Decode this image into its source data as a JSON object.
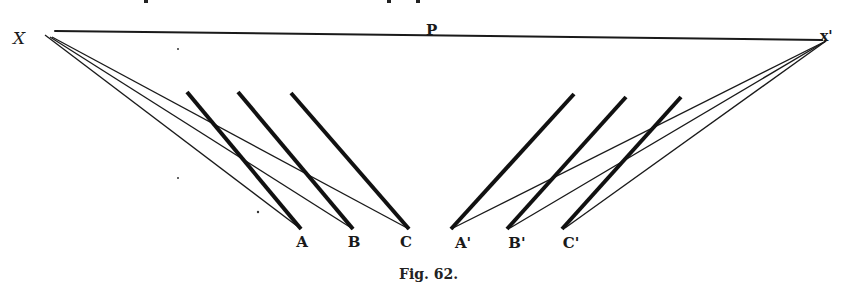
{
  "figure": {
    "caption": "Fig. 62.",
    "colors": {
      "ink": "#1a1a1a",
      "background": "#ffffff"
    },
    "points": {
      "X": {
        "label": "X",
        "x": 45,
        "y": 33
      },
      "X_prime": {
        "label": "x'",
        "x": 826,
        "y": 40
      },
      "P": {
        "label": "P",
        "x": 432,
        "y": 36
      }
    },
    "horizon_line": {
      "x1": 55,
      "y1": 31,
      "x2": 822,
      "y2": 40
    },
    "thick_segments": [
      {
        "name": "segment-A",
        "x1": 187,
        "y1": 92,
        "x2": 301,
        "y2": 229
      },
      {
        "name": "segment-B",
        "x1": 238,
        "y1": 92,
        "x2": 353,
        "y2": 229
      },
      {
        "name": "segment-C",
        "x1": 291,
        "y1": 93,
        "x2": 409,
        "y2": 229
      },
      {
        "name": "segment-A-prime",
        "x1": 574,
        "y1": 94,
        "x2": 451,
        "y2": 229
      },
      {
        "name": "segment-B-prime",
        "x1": 626,
        "y1": 97,
        "x2": 507,
        "y2": 229
      },
      {
        "name": "segment-C-prime",
        "x1": 681,
        "y1": 97,
        "x2": 562,
        "y2": 229
      }
    ],
    "thin_rays": [
      {
        "from": "X",
        "to": "A",
        "x1": 45,
        "y1": 35,
        "x2": 301,
        "y2": 229
      },
      {
        "from": "X",
        "to": "B",
        "x1": 50,
        "y1": 37,
        "x2": 353,
        "y2": 229
      },
      {
        "from": "X",
        "to": "C",
        "x1": 52,
        "y1": 37,
        "x2": 409,
        "y2": 229
      },
      {
        "from": "X'",
        "to": "A'",
        "x1": 826,
        "y1": 41,
        "x2": 451,
        "y2": 229
      },
      {
        "from": "X'",
        "to": "B'",
        "x1": 826,
        "y1": 41,
        "x2": 510,
        "y2": 228
      },
      {
        "from": "X'",
        "to": "C'",
        "x1": 826,
        "y1": 41,
        "x2": 565,
        "y2": 228
      }
    ],
    "bottom_labels": [
      {
        "label": "A",
        "x": 302,
        "y": 247
      },
      {
        "label": "B",
        "x": 354,
        "y": 247
      },
      {
        "label": "C",
        "x": 406,
        "y": 247
      },
      {
        "label": "A'",
        "x": 463,
        "y": 248
      },
      {
        "label": "B'",
        "x": 517,
        "y": 248
      },
      {
        "label": "C'",
        "x": 571,
        "y": 248
      }
    ]
  }
}
